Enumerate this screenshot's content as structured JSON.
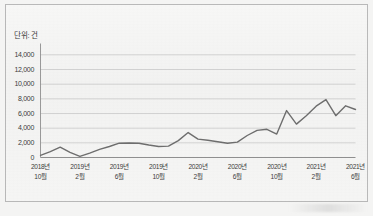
{
  "chart_data": {
    "type": "line",
    "title": "",
    "subtitle": "",
    "unit_label": "단위: 건",
    "xlabel": "",
    "ylabel": "",
    "ylim": [
      0,
      15000
    ],
    "grid": true,
    "legend": "none",
    "y_ticks": [
      "0",
      "2,000",
      "4,000",
      "6,000",
      "8,000",
      "10,000",
      "12,000",
      "14,000"
    ],
    "y_tick_values": [
      0,
      2000,
      4000,
      6000,
      8000,
      10000,
      12000,
      14000
    ],
    "x_tick_labels": [
      {
        "year": "2018년",
        "month": "10월"
      },
      {
        "year": "2019년",
        "month": "2월"
      },
      {
        "year": "2019년",
        "month": "6월"
      },
      {
        "year": "2019년",
        "month": "10월"
      },
      {
        "year": "2020년",
        "month": "2월"
      },
      {
        "year": "2020년",
        "month": "6월"
      },
      {
        "year": "2020년",
        "month": "10월"
      },
      {
        "year": "2021년",
        "month": "2월"
      },
      {
        "year": "2021년",
        "month": "6월"
      }
    ],
    "x": [
      "2018-10",
      "2018-11",
      "2018-12",
      "2019-01",
      "2019-02",
      "2019-03",
      "2019-04",
      "2019-05",
      "2019-06",
      "2019-07",
      "2019-08",
      "2019-09",
      "2019-10",
      "2019-11",
      "2019-12",
      "2020-01",
      "2020-02",
      "2020-03",
      "2020-04",
      "2020-05",
      "2020-06",
      "2020-07",
      "2020-08",
      "2020-09",
      "2020-10",
      "2020-11",
      "2020-12",
      "2021-01",
      "2021-02",
      "2021-03",
      "2021-04",
      "2021-05",
      "2021-06"
    ],
    "series": [
      {
        "name": "건수",
        "color": "#6e6e6e",
        "values": [
          300,
          800,
          1400,
          700,
          150,
          600,
          1100,
          1500,
          1950,
          1980,
          1950,
          1700,
          1500,
          1550,
          2300,
          3400,
          2500,
          2350,
          2150,
          1950,
          2100,
          3000,
          3700,
          3850,
          3200,
          6400,
          4550,
          5700,
          7000,
          7900,
          5700,
          7050,
          6550
        ]
      }
    ],
    "line_color": "#6e6e6e",
    "line_width": 1.4,
    "extra_points_note": "",
    "peak_value": 13200,
    "min_value": 150
  },
  "chart_colors": {
    "background": "#f4f4f3",
    "plot_background": "#f5f5f4",
    "grid": "#c9c9c9",
    "axis": "#8f8f8f",
    "text": "#3d3d3d",
    "border": "#b9b9b9"
  }
}
